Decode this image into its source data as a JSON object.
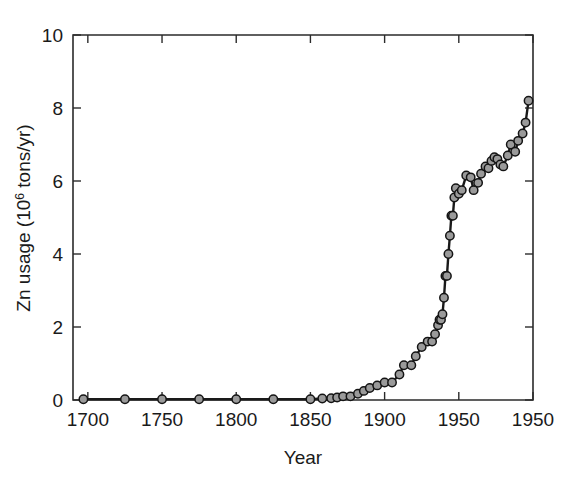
{
  "chart_data": {
    "type": "line",
    "title": "",
    "subtitle": "",
    "xlabel": "Year",
    "ylabel": "Zn usage (10⁶ tons/yr)",
    "ylabel_parts": {
      "prefix": "Zn usage (10",
      "superscript": "6",
      "suffix": " tons/yr)"
    },
    "xlim": [
      1690,
      2000
    ],
    "ylim": [
      0,
      10
    ],
    "grid": false,
    "legend": null,
    "marker": "open-circle",
    "xticks": [
      1700,
      1750,
      1800,
      1850,
      1900,
      1950,
      2000
    ],
    "xtick_labels": [
      "1700",
      "1750",
      "1800",
      "1850",
      "1900",
      "1950",
      "1950"
    ],
    "yticks": [
      0,
      2,
      4,
      6,
      8,
      10
    ],
    "ytick_labels": [
      "0",
      "2",
      "4",
      "6",
      "8",
      "10"
    ],
    "series": [
      {
        "name": "Zn usage",
        "x": [
          1697,
          1725,
          1750,
          1775,
          1800,
          1825,
          1850,
          1858,
          1864,
          1868,
          1872,
          1877,
          1882,
          1886,
          1890,
          1895,
          1900,
          1905,
          1910,
          1913,
          1918,
          1921,
          1925,
          1929,
          1932,
          1934,
          1936,
          1937,
          1938,
          1939,
          1940,
          1941,
          1942,
          1943,
          1944,
          1945,
          1946,
          1947,
          1948,
          1950,
          1952,
          1955,
          1958,
          1960,
          1963,
          1965,
          1968,
          1970,
          1972,
          1974,
          1976,
          1978,
          1980,
          1983,
          1985,
          1988,
          1990,
          1993,
          1995,
          1997
        ],
        "y": [
          0.02,
          0.02,
          0.02,
          0.02,
          0.02,
          0.02,
          0.02,
          0.04,
          0.05,
          0.07,
          0.1,
          0.1,
          0.17,
          0.25,
          0.33,
          0.4,
          0.48,
          0.48,
          0.7,
          0.95,
          0.95,
          1.2,
          1.45,
          1.6,
          1.6,
          1.8,
          2.05,
          2.2,
          2.2,
          2.35,
          2.8,
          3.4,
          3.4,
          4.0,
          4.5,
          5.05,
          5.05,
          5.55,
          5.8,
          5.65,
          5.75,
          6.15,
          6.1,
          5.75,
          5.95,
          6.2,
          6.4,
          6.35,
          6.55,
          6.65,
          6.6,
          6.45,
          6.4,
          6.7,
          7.0,
          6.8,
          7.1,
          7.3,
          7.6,
          8.2
        ],
        "color": "#1a1a1a"
      }
    ],
    "annotations": []
  },
  "figure": {
    "background_color": "#ffffff",
    "axis_color": "#2b2b2b",
    "line_color": "#1a1a1a",
    "marker_fill": "#9a9a9a"
  }
}
